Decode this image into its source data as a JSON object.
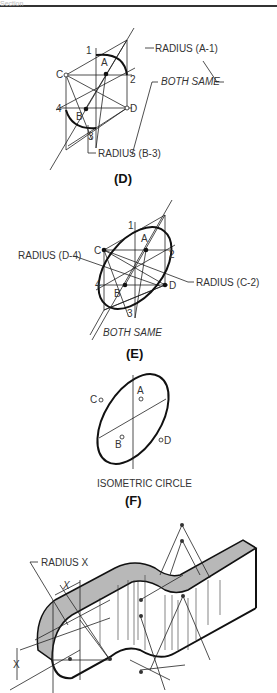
{
  "header": {
    "section_label": "Section"
  },
  "figure_d": {
    "caption": "(D)",
    "points": {
      "a": "A",
      "b": "B",
      "c": "C",
      "d": "D",
      "p1": "1",
      "p2": "2",
      "p3": "3",
      "p4": "4"
    },
    "labels": {
      "radius_a1": "RADIUS (A-1)",
      "both_same": "BOTH SAME",
      "radius_b3": "RADIUS (B-3)"
    }
  },
  "figure_e": {
    "caption": "(E)",
    "points": {
      "a": "A",
      "b": "B",
      "c": "C",
      "d": "D",
      "p1": "1",
      "p2": "2",
      "p3": "3",
      "p4": "4"
    },
    "labels": {
      "radius_d4": "RADIUS (D-4)",
      "radius_c2": "RADIUS (C-2)",
      "both_same": "BOTH SAME"
    }
  },
  "figure_f": {
    "caption": "(F)",
    "title": "ISOMETRIC CIRCLE",
    "points": {
      "a": "A",
      "b": "B",
      "c": "C",
      "d": "D"
    }
  },
  "figure_g": {
    "labels": {
      "radius_x": "RADIUS X",
      "x_dim_top": "X",
      "x_dim_side": "X"
    },
    "fill_color": "#b8b8b8"
  }
}
